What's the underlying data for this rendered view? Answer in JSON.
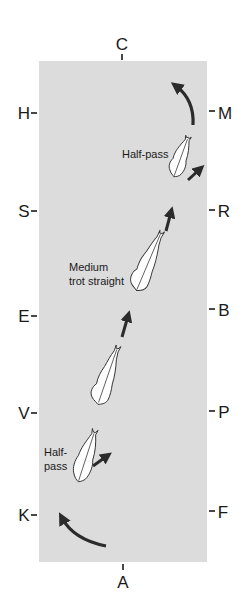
{
  "diagram": {
    "colors": {
      "arena_fill": "#dcdcdc",
      "arrow": "#2b2b2b",
      "horse_fill": "#ffffff",
      "horse_stroke": "#333333",
      "text": "#1a1a1a"
    },
    "markers": {
      "top": "C",
      "bottom": "A",
      "left": [
        "H",
        "S",
        "E",
        "V",
        "K"
      ],
      "right": [
        "M",
        "R",
        "B",
        "P",
        "F"
      ]
    },
    "labels": {
      "half_pass_top": "Half-pass",
      "medium_trot_line1": "Medium",
      "medium_trot_line2": "trot straight",
      "half_pass_bottom_line1": "Half-",
      "half_pass_bottom_line2": "pass"
    },
    "movements": [
      {
        "name": "turn-at-K",
        "type": "curved-arrow"
      },
      {
        "name": "half-pass",
        "type": "horse-with-arrow"
      },
      {
        "name": "trot",
        "type": "horse-with-arrow"
      },
      {
        "name": "medium-trot-straight",
        "type": "horse-with-arrow"
      },
      {
        "name": "half-pass",
        "type": "horse-with-arrow"
      },
      {
        "name": "turn-at-M",
        "type": "curved-arrow"
      }
    ]
  }
}
